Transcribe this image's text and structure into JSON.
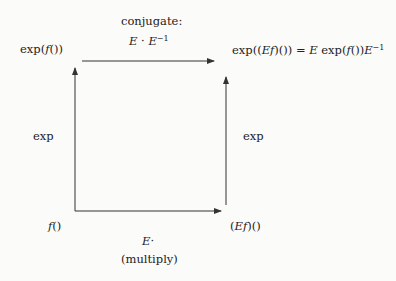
{
  "diagram": {
    "type": "commutative-square",
    "nodes": {
      "top_left": "exp(f())",
      "top_right": "exp((Ef)()) = E exp(f()) E^-1",
      "bottom_left": "f()",
      "bottom_right": "(Ef)()"
    },
    "edges": {
      "top": {
        "label_line1": "conjugate:",
        "label_line2": "E · E^-1"
      },
      "left": {
        "label": "exp"
      },
      "right": {
        "label": "exp"
      },
      "bottom": {
        "label_line1": "E·",
        "label_line2": "(multiply)"
      }
    }
  }
}
